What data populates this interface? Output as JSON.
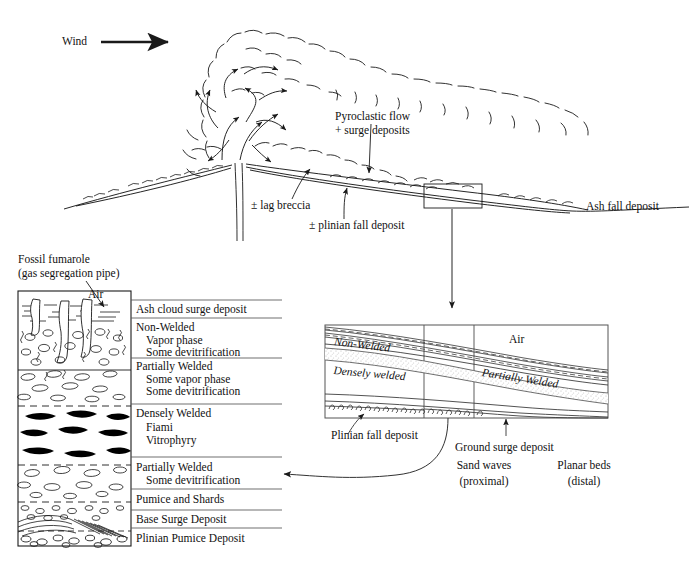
{
  "figure": {
    "kind": "volcanic-eruption-deposit-diagram",
    "ink": "#1a1a1a",
    "stipple": "#cfcfcf"
  },
  "top_panel": {
    "wind_label": "Wind",
    "wind_arrow": "right-arrow",
    "pyroclastic_label_line1": "Pyroclastic flow",
    "pyroclastic_label_line2": "+ surge deposits",
    "lag_breccia_label": "± lag breccia",
    "plinian_fall_label": "± plinian fall deposit",
    "ash_fall_label": "Ash fall deposit"
  },
  "column_panel": {
    "title_line1": "Fossil fumarole",
    "title_line2": "(gas segregation pipe)",
    "air_label": "Air",
    "units": [
      {
        "name": "Ash cloud surge deposit",
        "sub": []
      },
      {
        "name": "Non-Welded",
        "sub": [
          "Vapor phase",
          "Some devitrification"
        ]
      },
      {
        "name": "Partially Welded",
        "sub": [
          "Some vapor phase",
          "Some devitrification"
        ]
      },
      {
        "name": "Densely Welded",
        "sub": [
          "Fiami",
          "Vitrophyry"
        ]
      },
      {
        "name": "Partially Welded",
        "sub": [
          "Some devitrification"
        ]
      },
      {
        "name": "Pumice and Shards",
        "sub": []
      },
      {
        "name": "Base Surge Deposit",
        "sub": []
      },
      {
        "name": "Plinian Pumice Deposit",
        "sub": []
      }
    ]
  },
  "inset_panel": {
    "zone_non_welded": "Non-Welded",
    "zone_densely_welded": "Densely welded",
    "zone_partially_welded": "Partially Welded",
    "zone_air": "Air",
    "plinian_fall_label": "Plinian fall deposit",
    "ground_surge_label": "Ground surge deposit",
    "sand_waves_line1": "Sand waves",
    "sand_waves_line2": "(proximal)",
    "planar_beds_line1": "Planar beds",
    "planar_beds_line2": "(distal)"
  }
}
